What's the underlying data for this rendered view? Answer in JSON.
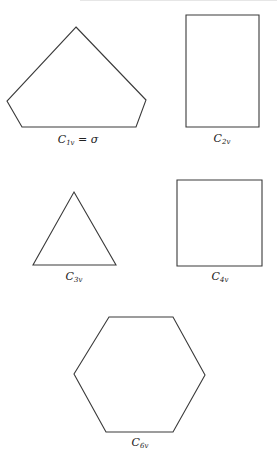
{
  "figure": {
    "shapes": [
      {
        "id": "pentagon",
        "type": "polygon",
        "points": "76,27 146,100 136,127 22,127 7,101",
        "label": {
          "main": "C",
          "sub": "1v",
          "suffix": " = σ",
          "x": 78,
          "y": 134
        }
      },
      {
        "id": "rectangle",
        "type": "polygon",
        "points": "186,15 259,15 259,127 186,127",
        "label": {
          "main": "C",
          "sub": "2v",
          "suffix": "",
          "x": 222,
          "y": 133
        }
      },
      {
        "id": "triangle",
        "type": "polygon",
        "points": "74,192 116,265 33,265",
        "label": {
          "main": "C",
          "sub": "3v",
          "suffix": "",
          "x": 74,
          "y": 271
        }
      },
      {
        "id": "square",
        "type": "polygon",
        "points": "177,180 262,180 262,266 177,266",
        "label": {
          "main": "C",
          "sub": "4v",
          "suffix": "",
          "x": 220,
          "y": 271
        }
      },
      {
        "id": "hexagon",
        "type": "polygon",
        "points": "109,317 173,317 205,375 173,432 106,432 74,374",
        "label": {
          "main": "C",
          "sub": "6v",
          "suffix": "",
          "x": 140,
          "y": 437
        }
      }
    ],
    "stroke_color": "#3a3a3a",
    "background": "#ffffff"
  }
}
